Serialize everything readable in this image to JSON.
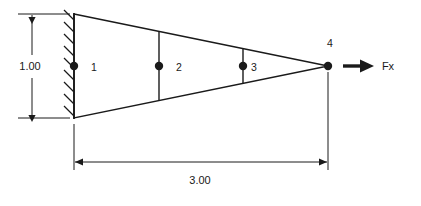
{
  "diagram": {
    "colors": {
      "line": "#1a1a1a",
      "background": "#ffffff",
      "text": "#1a1a1a"
    },
    "dimensions": {
      "height": {
        "value": "1.00",
        "label_name": "height-dimension",
        "orientation": "vertical"
      },
      "length": {
        "value": "3.00",
        "label_name": "length-dimension",
        "orientation": "horizontal"
      }
    },
    "elements": [
      {
        "label": "1",
        "x": 94,
        "y": 71
      },
      {
        "label": "2",
        "x": 179,
        "y": 71
      },
      {
        "label": "3",
        "x": 254,
        "y": 71
      }
    ],
    "nodes": [
      {
        "label": "",
        "cx": 74,
        "cy": 66,
        "r": 4.0,
        "name": "node-1-dot"
      },
      {
        "label": "",
        "cx": 159,
        "cy": 66,
        "r": 4.0,
        "name": "node-2-dot"
      },
      {
        "label": "",
        "cx": 243,
        "cy": 66,
        "r": 4.0,
        "name": "node-3-dot"
      },
      {
        "label": "4",
        "cx": 328,
        "cy": 66,
        "r": 4.0,
        "name": "node-4-dot"
      }
    ],
    "node4_label": {
      "text": "4",
      "x": 330,
      "y": 47
    },
    "force": {
      "label": "Fx",
      "direction": "right",
      "label_x": 388,
      "label_y": 70
    },
    "support": {
      "type": "fixed-wall-hatched",
      "side": "left"
    },
    "geometry": {
      "wall_x": 74,
      "top_left_y": 14,
      "bottom_left_y": 118,
      "apex_x": 328,
      "apex_y": 66
    }
  }
}
